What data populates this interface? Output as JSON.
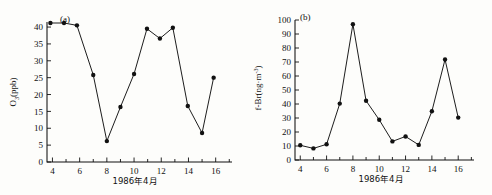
{
  "figure": {
    "background_color": "#fdfdfb",
    "ink_color": "#111111",
    "panel_count": 2
  },
  "panel_a": {
    "tag": "(a)",
    "ylabel_main": "O",
    "ylabel_sub": "3",
    "ylabel_unit": "(ppb)",
    "ylabel_full": "O3(ppb)",
    "xlabel": "1986年4月",
    "ytick_labels": [
      "0",
      "5",
      "10",
      "15",
      "20",
      "25",
      "30",
      "35",
      "40"
    ],
    "xtick_labels": [
      "4",
      "6",
      "8",
      "10",
      "12",
      "14",
      "16"
    ]
  },
  "panel_b": {
    "tag": "(b)",
    "ylabel_main": "f-Br(ng·m",
    "ylabel_sup": "-3",
    "ylabel_close": ")",
    "ylabel_full": "f-Br(ng·m-3)",
    "xlabel": "1986年4月",
    "ytick_labels": [
      "0",
      "10",
      "20",
      "30",
      "40",
      "50",
      "60",
      "70",
      "80",
      "90",
      "100"
    ],
    "xtick_labels": [
      "4",
      "6",
      "8",
      "10",
      "12",
      "14",
      "16"
    ]
  },
  "chart_data": [
    {
      "type": "line",
      "panel": "(a)",
      "title": "(a)",
      "xlabel": "1986年4月",
      "ylabel": "O3(ppb)",
      "xlim": [
        3.6,
        17.2
      ],
      "ylim": [
        0,
        41.5
      ],
      "ytick_values": [
        0,
        5,
        10,
        15,
        20,
        25,
        30,
        35,
        40
      ],
      "xtick_values": [
        4,
        6,
        8,
        10,
        12,
        14,
        16
      ],
      "xtick_minor_values": [
        5,
        7,
        9,
        11,
        13,
        15,
        17
      ],
      "grid": false,
      "legend": false,
      "marker": "filled-circle",
      "x": [
        3.85,
        4.85,
        5.8,
        7.0,
        8.0,
        9.0,
        10.0,
        10.95,
        11.9,
        12.85,
        13.95,
        15.0,
        15.85
      ],
      "y": [
        41.2,
        41.2,
        40.5,
        25.8,
        6.2,
        16.3,
        26.1,
        39.5,
        36.6,
        39.8,
        16.6,
        8.6,
        25.0
      ],
      "values": [
        {
          "x": 3.85,
          "y": 41.2
        },
        {
          "x": 4.85,
          "y": 41.2
        },
        {
          "x": 5.8,
          "y": 40.5
        },
        {
          "x": 7.0,
          "y": 25.8
        },
        {
          "x": 8.0,
          "y": 6.2
        },
        {
          "x": 9.0,
          "y": 16.3
        },
        {
          "x": 10.0,
          "y": 26.1
        },
        {
          "x": 10.95,
          "y": 39.5
        },
        {
          "x": 11.9,
          "y": 36.6
        },
        {
          "x": 12.85,
          "y": 39.8
        },
        {
          "x": 13.95,
          "y": 16.6
        },
        {
          "x": 15.0,
          "y": 8.6
        },
        {
          "x": 15.85,
          "y": 25.0
        }
      ]
    },
    {
      "type": "line",
      "panel": "(b)",
      "title": "(b)",
      "xlabel": "1986年4月",
      "ylabel": "f-Br(ng·m-3)",
      "xlim": [
        3.6,
        17.2
      ],
      "ylim": [
        0,
        100
      ],
      "ytick_values": [
        0,
        10,
        20,
        30,
        40,
        50,
        60,
        70,
        80,
        90,
        100
      ],
      "xtick_values": [
        4,
        6,
        8,
        10,
        12,
        14,
        16
      ],
      "xtick_minor_values": [
        5,
        7,
        9,
        11,
        13,
        15,
        17
      ],
      "grid": false,
      "legend": false,
      "marker": "filled-circle",
      "x": [
        4.0,
        5.0,
        6.0,
        7.0,
        8.0,
        9.0,
        10.0,
        11.0,
        12.0,
        13.0,
        14.0,
        15.0,
        16.0
      ],
      "y": [
        10.5,
        8.3,
        11.2,
        40.3,
        97.0,
        42.3,
        28.7,
        13.3,
        16.8,
        10.8,
        34.8,
        71.8,
        30.3
      ],
      "values": [
        {
          "x": 4.0,
          "y": 10.5
        },
        {
          "x": 5.0,
          "y": 8.3
        },
        {
          "x": 6.0,
          "y": 11.2
        },
        {
          "x": 7.0,
          "y": 40.3
        },
        {
          "x": 8.0,
          "y": 97.0
        },
        {
          "x": 9.0,
          "y": 42.3
        },
        {
          "x": 10.0,
          "y": 28.7
        },
        {
          "x": 11.0,
          "y": 13.3
        },
        {
          "x": 12.0,
          "y": 16.8
        },
        {
          "x": 13.0,
          "y": 10.8
        },
        {
          "x": 14.0,
          "y": 34.8
        },
        {
          "x": 15.0,
          "y": 71.8
        },
        {
          "x": 16.0,
          "y": 30.3
        }
      ]
    }
  ]
}
